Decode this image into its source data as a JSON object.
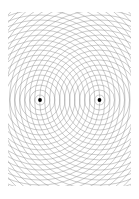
{
  "figure": {
    "title": "Two-source concentric circle interference pattern",
    "type": "geometric-line-diagram",
    "canvas": {
      "width": 139,
      "height": 199,
      "background_color": "#ffffff"
    },
    "style": {
      "line_color": "#8c8c8c",
      "line_width": 0.45,
      "dot_color": "#000000",
      "dot_radius": 1.9
    },
    "pattern": {
      "description": "Two overlapping families of equally spaced concentric circles whose intersections form a moire / interference lattice resembling a vesica and lens shape between the two centers.",
      "ring_spacing": 5,
      "ring_count_per_center": 25,
      "first_ring_radius": 5,
      "clip_bounds": {
        "x": 8,
        "y": 12,
        "width": 123,
        "height": 174
      }
    },
    "centers": [
      {
        "name": "left-focus",
        "cx": 40,
        "cy": 100,
        "label": ""
      },
      {
        "name": "right-focus",
        "cx": 99.5,
        "cy": 100,
        "label": ""
      }
    ]
  }
}
